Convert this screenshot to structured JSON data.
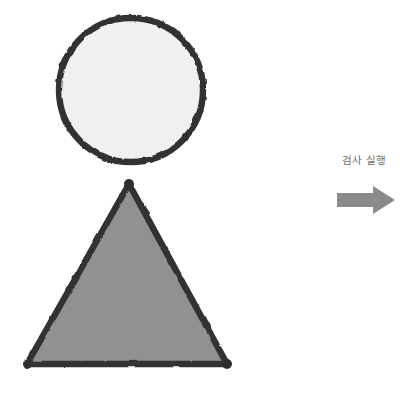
{
  "canvas": {
    "width": 400,
    "height": 395,
    "background": "#ffffff"
  },
  "figure": {
    "title": "",
    "shapes": [
      {
        "name": "circle",
        "kind": "circle",
        "cx": 131,
        "cy": 90,
        "r": 72,
        "fill": "#f0f0f0",
        "stroke": "#333333",
        "stroke_width": 6,
        "label": ""
      },
      {
        "name": "triangle",
        "kind": "triangle",
        "points": "129,184 27,364 227,364",
        "apex": [
          129,
          184
        ],
        "bottom_left": [
          27,
          364
        ],
        "bottom_right": [
          227,
          364
        ],
        "fill": "#919191",
        "stroke": "#333333",
        "stroke_width": 6,
        "vertex_dot_r": 5,
        "label": ""
      }
    ]
  },
  "action": {
    "label": "검사 실행",
    "arrow": {
      "name": "right-arrow",
      "direction": "right",
      "fill": "#8a8a8a",
      "x": 337,
      "y": 188,
      "width": 58,
      "height": 25
    }
  },
  "colors": {
    "outline": "#333333",
    "circle_fill": "#f0f0f0",
    "triangle_fill": "#919191",
    "arrow_fill": "#8a8a8a",
    "label_text": "#6f6f6f",
    "background": "#ffffff"
  }
}
